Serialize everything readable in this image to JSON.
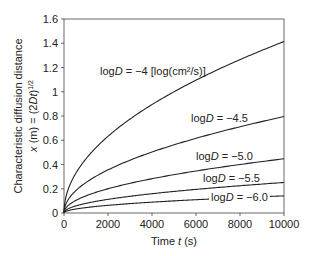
{
  "chart_data": {
    "type": "line",
    "title": "",
    "xlabel": "Time t (s)",
    "ylabel_line1": "Characteristic diffusion distance",
    "ylabel_line2": "x (m) = (2Dt)^1/2",
    "xlim": [
      0,
      10000
    ],
    "ylim": [
      0,
      1.6
    ],
    "x_ticks": [
      0,
      2000,
      4000,
      6000,
      8000,
      10000
    ],
    "y_ticks": [
      0,
      0.2,
      0.4,
      0.6,
      0.8,
      1,
      1.2,
      1.4,
      1.6
    ],
    "y_tick_labels": [
      "0",
      "0.2",
      "0.4",
      "0.6",
      "0.8",
      "1",
      "1.2",
      "1.4",
      "1.6"
    ],
    "grid": false,
    "legend": "inline labels",
    "series": [
      {
        "name": "logD = -4 [log(cm2/s)]",
        "logD": -4.0,
        "end_value": 1.414
      },
      {
        "name": "logD = -4.5",
        "logD": -4.5,
        "end_value": 0.795
      },
      {
        "name": "logD = -5.0",
        "logD": -5.0,
        "end_value": 0.447
      },
      {
        "name": "logD = -5.5",
        "logD": -5.5,
        "end_value": 0.251
      },
      {
        "name": "logD = -6.0",
        "logD": -6.0,
        "end_value": 0.141
      }
    ]
  },
  "labels": {
    "s1": "logD = −4 [log(cm²/s)]",
    "s2": "logD = −4.5",
    "s3": "logD = −5.0",
    "s4": "logD = −5.5",
    "s5": "logD = −6.0",
    "xlabel": "Time t (s)"
  }
}
